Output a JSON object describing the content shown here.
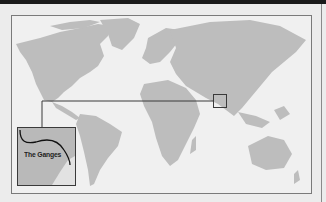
{
  "map": {
    "title": "World map highlighting region",
    "inset_label": "The Ganges",
    "colors": {
      "land": "#bdbdbd",
      "ocean": "#f0f0f0",
      "lines": "#3a3a3a",
      "inset_fill": "#b9b9b9"
    },
    "highlight_region": "Ganges basin (South Asia)"
  }
}
